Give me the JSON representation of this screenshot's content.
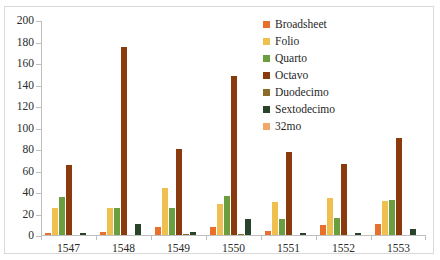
{
  "chart_data": {
    "type": "bar",
    "title": "",
    "subtitle": "",
    "xlabel": "",
    "ylabel": "",
    "categories": [
      "1547",
      "1548",
      "1549",
      "1550",
      "1551",
      "1552",
      "1553"
    ],
    "ylim": [
      0,
      200
    ],
    "yticks": [
      0,
      20,
      40,
      60,
      80,
      100,
      120,
      140,
      160,
      180,
      200
    ],
    "ytick_labels": [
      "0",
      "20",
      "40",
      "60",
      "80",
      "100",
      "120",
      "140",
      "160",
      "180",
      "200"
    ],
    "grid": false,
    "legend_position": "inside-top-right",
    "series": [
      {
        "name": "Broadsheet",
        "color": "#e8702a",
        "values": [
          2,
          3,
          7,
          7,
          4,
          9,
          10
        ]
      },
      {
        "name": "Folio",
        "color": "#efc050",
        "values": [
          25,
          25,
          44,
          29,
          31,
          34,
          32
        ]
      },
      {
        "name": "Quarto",
        "color": "#6b9e3f",
        "values": [
          35,
          25,
          25,
          36,
          15,
          16,
          33
        ]
      },
      {
        "name": "Octavo",
        "color": "#8b3a0e",
        "values": [
          65,
          175,
          80,
          148,
          77,
          66,
          90
        ]
      },
      {
        "name": "Duodecimo",
        "color": "#8a6d2b",
        "values": [
          0,
          0,
          1,
          1,
          0,
          0,
          0
        ]
      },
      {
        "name": "Sextodecimo",
        "color": "#29442b",
        "values": [
          2,
          10,
          3,
          15,
          2,
          2,
          6
        ]
      },
      {
        "name": "32mo",
        "color": "#f0a868",
        "values": [
          0,
          0,
          0,
          0,
          0,
          0,
          0
        ]
      }
    ]
  },
  "legend": {
    "items": [
      {
        "label": "Broadsheet"
      },
      {
        "label": "Folio"
      },
      {
        "label": "Quarto"
      },
      {
        "label": "Octavo"
      },
      {
        "label": "Duodecimo"
      },
      {
        "label": "Sextodecimo"
      },
      {
        "label": "32mo"
      }
    ]
  },
  "colors": {
    "axis": "#bfbfbf",
    "border": "#d9d9d9",
    "text": "#2b2b2b",
    "background": "#ffffff"
  }
}
